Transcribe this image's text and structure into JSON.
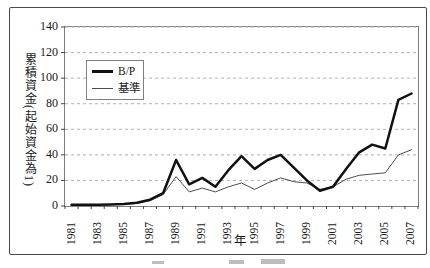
{
  "chart_data": {
    "type": "line",
    "title": "",
    "xlabel": "年",
    "ylabel": "累積資金(起始資金為1)",
    "x": [
      1981,
      1982,
      1983,
      1984,
      1985,
      1986,
      1987,
      1988,
      1989,
      1990,
      1991,
      1992,
      1993,
      1994,
      1995,
      1996,
      1997,
      1998,
      1999,
      2000,
      2001,
      2002,
      2003,
      2004,
      2005,
      2006,
      2007
    ],
    "x_tick_labels": [
      "1981",
      "1983",
      "1985",
      "1987",
      "1989",
      "1991",
      "1993",
      "1995",
      "1997",
      "1999",
      "2001",
      "2003",
      "2005",
      "2007"
    ],
    "ylim": [
      0,
      140
    ],
    "y_ticks": [
      0,
      20,
      40,
      60,
      80,
      100,
      120,
      140
    ],
    "grid": "horizontal-dashed",
    "legend_position": "upper-left-inside",
    "colors": {
      "gridline": "#b0b0b0",
      "axis": "#444444",
      "plot_border": "#808080",
      "frame_border": "#4a4a4a"
    },
    "series": [
      {
        "name": "B/P",
        "color": "#111111",
        "width": 2.5,
        "values": [
          1,
          1,
          1,
          1.2,
          1.5,
          2.5,
          5,
          10,
          36,
          17,
          22,
          15,
          28,
          39,
          29,
          36,
          40,
          30,
          20,
          12,
          15,
          29,
          42,
          48,
          45,
          83,
          88
        ]
      },
      {
        "name": "基準",
        "color": "#4d4d4d",
        "width": 1,
        "values": [
          1,
          1,
          1,
          1.1,
          1.3,
          2,
          4,
          9,
          23,
          11,
          14,
          11,
          15,
          18,
          13,
          18,
          22,
          19,
          18,
          13,
          15,
          21,
          24,
          25,
          26,
          40,
          44
        ]
      }
    ]
  }
}
